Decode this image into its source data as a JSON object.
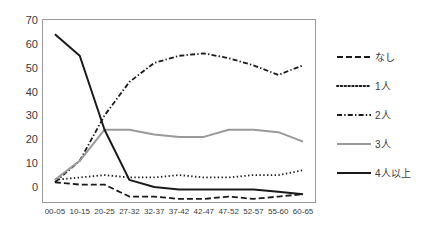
{
  "chart_data": {
    "type": "line",
    "title": "",
    "xlabel": "",
    "ylabel": "",
    "ylim": [
      -7,
      70
    ],
    "yticks": [
      0,
      10,
      20,
      30,
      40,
      50,
      60,
      70
    ],
    "grid": false,
    "legend_position": "right",
    "categories": [
      "00-05",
      "10-15",
      "20-25",
      "27-32",
      "32-37",
      "37-42",
      "42-47",
      "47-52",
      "52-57",
      "55-60",
      "60-65"
    ],
    "series": [
      {
        "name": "なし",
        "style": "dashed",
        "color": "#1a1a1a",
        "values": [
          2,
          1,
          1,
          -4,
          -4,
          -5,
          -5,
          -4,
          -5,
          -4,
          -3
        ]
      },
      {
        "name": "1人",
        "style": "dotted",
        "color": "#1a1a1a",
        "values": [
          3,
          4,
          5,
          4,
          4,
          5,
          4,
          4,
          5,
          5,
          7
        ]
      },
      {
        "name": "2人",
        "style": "dashdot",
        "color": "#1a1a1a",
        "values": [
          2,
          11,
          30,
          44,
          52,
          55,
          56,
          54,
          51,
          47,
          51
        ]
      },
      {
        "name": "3人",
        "style": "solid",
        "color": "#9a9a9a",
        "values": [
          3,
          11,
          24,
          24,
          22,
          21,
          21,
          24,
          24,
          23,
          19
        ]
      },
      {
        "name": "4人以上",
        "style": "solid",
        "color": "#1a1a1a",
        "values": [
          64,
          55,
          24,
          3,
          0,
          -1,
          -1,
          -1,
          -1,
          -2,
          -3
        ]
      }
    ]
  },
  "legend": {
    "items": [
      {
        "label": "なし"
      },
      {
        "label": "1人"
      },
      {
        "label": "2人"
      },
      {
        "label": "3人"
      },
      {
        "label": "4人以上"
      }
    ]
  },
  "yaxis": {
    "labels": [
      "70",
      "60",
      "50",
      "40",
      "30",
      "20",
      "10",
      "0"
    ]
  },
  "colors": {
    "axis": "#9a9a9a",
    "text": "#3a3a3a",
    "line_dark": "#1a1a1a",
    "line_gray": "#9a9a9a",
    "background": "#ffffff"
  }
}
